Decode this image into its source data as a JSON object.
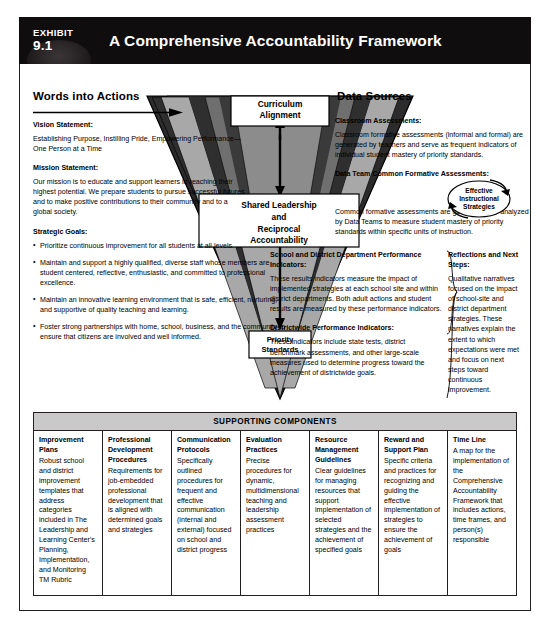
{
  "header": {
    "exhibit_word": "EXHIBIT",
    "exhibit_number": "9.1",
    "title": "A Comprehensive Accountability Framework"
  },
  "left_column": {
    "heading": "Words into Actions",
    "vision_label": "Vision Statement:",
    "vision_text": "Establishing Purpose, Instilling Pride, Empowering Performance—One Person at a Time",
    "mission_label": "Mission Statement:",
    "mission_text": "Our mission is to educate and support learners in reaching their highest potential. We prepare students to pursue successful futures and to make positive contributions to their community and to a global society.",
    "goals_label": "Strategic Goals:",
    "goals": [
      "Prioritize continuous improvement for all students at all levels.",
      "Maintain and support a highly qualified, diverse staff whose members are student centered, reflective, enthusiastic, and committed to professional excellence.",
      "Maintain an innovative learning environment that is safe, efficient, nurturing, and supportive of quality teaching and learning.",
      "Foster strong partnerships with home, school, business, and the community to ensure that citizens are involved and well informed."
    ]
  },
  "triangle": {
    "boxes": [
      {
        "id": "curriculum-alignment",
        "lines": [
          "Curriculum",
          "Alignment"
        ]
      },
      {
        "id": "shared-leadership",
        "lines": [
          "Shared Leadership",
          "and",
          "Reciprocal",
          "Accountability"
        ]
      },
      {
        "id": "priority-standards",
        "lines": [
          "Priority",
          "Standards"
        ]
      }
    ]
  },
  "right_column": {
    "heading": "Data Sources",
    "classroom_label": "Classroom Assessments:",
    "classroom_text": "Classroom formative assessments (informal and formal) are generated by teachers and serve as frequent indicators of individual student mastery of priority standards.",
    "datateam_label": "Data Team Common Formative Assessments:",
    "datateam_text": "Common formative assessments are generated and analyzed by Data Teams to measure student mastery of priority standards within specific units of instruction.",
    "school_label": "School and District Department Performance Indicators:",
    "school_text": "These results indicators measure the impact of implemented strategies at each school site and within district departments. Both adult actions and student results are measured by these performance indicators.",
    "districtwide_label": "Districtwide Performance Indicators:",
    "districtwide_text": "These indicators include state tests, district benchmark assessments, and other large-scale measures used to determine progress toward the achievement of districtwide goals.",
    "reflections_label": "Reflections and Next Steps:",
    "reflections_text": "Qualitative narratives focused on the impact of school-site and district department strategies. These narratives explain the extent to which expectations were met and focus on next steps toward continuous improvement."
  },
  "effective_strategies": {
    "lines": [
      "Effective",
      "Instructional",
      "Strategies"
    ]
  },
  "supporting": {
    "title": "SUPPORTING COMPONENTS",
    "columns": [
      {
        "title": "Improvement Plans",
        "body": "Robust school and district improvement templates that address categories included in The Leadership and Learning Center's Planning, Implementation, and Monitoring TM Rubric"
      },
      {
        "title": "Professional Development Procedures",
        "body": "Requirements for job-embedded professional development that is aligned with determined goals and strategies"
      },
      {
        "title": "Communication Protocols",
        "body": "Specifically outlined procedures for frequent and effective communication (internal and external) focused on school and district progress"
      },
      {
        "title": "Evaluation Practices",
        "body": "Precise procedures for dynamic, multidimensional teaching and leadership assessment practices"
      },
      {
        "title": "Resource Management Guidelines",
        "body": "Clear guidelines for managing resources that support implementation of selected strategies and the achievement of specified goals"
      },
      {
        "title": "Reward and Support Plan",
        "body": "Specific criteria and practices for recognizing and guiding the effective implementation of strategies to ensure the achievement of goals"
      },
      {
        "title": "Time Line",
        "body": "A map for the implementation of the Comprehensive Accountability Framework that includes actions, time frames, and person(s) responsible"
      }
    ]
  },
  "colors": {
    "header_bg": "#0f0d0e",
    "header_text": "#ffffff",
    "frame_border": "#231f20",
    "supporting_title_bg": "#c9c9c9",
    "triangle_darkest": "#2b2b2b",
    "triangle_dark": "#4d4d4d",
    "triangle_mid": "#7d7d7d",
    "triangle_light": "#9d9d9d",
    "triangle_lightest": "#bdbdbd"
  }
}
